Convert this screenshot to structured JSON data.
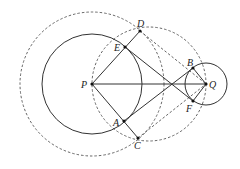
{
  "diagram": {
    "type": "geometry-construction",
    "points": {
      "P": {
        "label": "P",
        "x": 92,
        "y": 84
      },
      "Q": {
        "label": "Q",
        "x": 206,
        "y": 84
      },
      "D": {
        "label": "D",
        "x": 140,
        "y": 31
      },
      "E": {
        "label": "E",
        "x": 125,
        "y": 47
      },
      "A": {
        "label": "A",
        "x": 124,
        "y": 121
      },
      "C": {
        "label": "C",
        "x": 138,
        "y": 138
      },
      "B": {
        "label": "B",
        "x": 193,
        "y": 68
      },
      "F": {
        "label": "F",
        "x": 193,
        "y": 101
      }
    },
    "circles": [
      {
        "name": "circle-P",
        "center": "P",
        "r": 50,
        "style": "solid"
      },
      {
        "name": "circle-Q",
        "center": "Q",
        "r": 21,
        "style": "solid"
      },
      {
        "name": "circle-P-large",
        "center": "P",
        "r": 72,
        "style": "dashed"
      },
      {
        "name": "circle-diameter-PQ",
        "center": [
          149,
          84
        ],
        "r": 57,
        "style": "dashed"
      }
    ],
    "colors": {
      "stroke": "#333333",
      "dashed": "#555555",
      "background": "#ffffff"
    }
  }
}
